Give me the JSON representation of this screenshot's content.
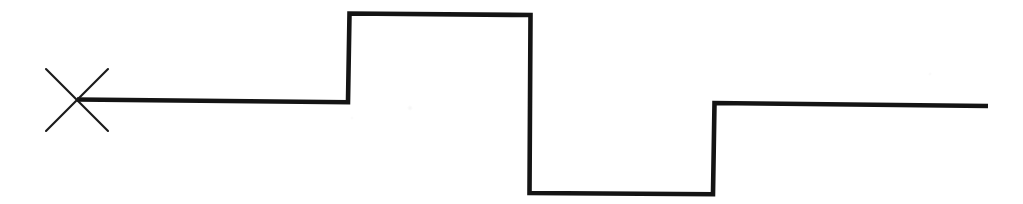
{
  "figure": {
    "kind": "line-drawing",
    "background_color": "#ffffff",
    "ink_color": "#141414",
    "canvas": {
      "width": 1023,
      "height": 204
    }
  },
  "chart_data": {
    "type": "line",
    "title": "",
    "subtitle": "",
    "xlabel": "",
    "ylabel": "",
    "legend": [],
    "legend_position": "none",
    "grid": false,
    "axis_visible": false,
    "tick_labels_x": [],
    "tick_labels_y": [],
    "xlim": [
      0,
      1023
    ],
    "ylim": [
      204,
      0
    ],
    "units": "pixels",
    "series": [
      {
        "name": "step-signal",
        "stroke_color": "#141414",
        "stroke_width": 4.6,
        "points": [
          [
            77,
            99.5
          ],
          [
            348,
            102.2
          ],
          [
            349.5,
            13.5
          ],
          [
            530.5,
            15.0
          ],
          [
            529.5,
            193.0
          ],
          [
            713,
            194.2
          ],
          [
            714.5,
            103.0
          ],
          [
            988,
            106.0
          ]
        ],
        "levels": [
          {
            "name": "baseline",
            "x_start": 77,
            "x_end": 348,
            "y_start": 99.5,
            "y_end": 102.2
          },
          {
            "name": "high-plateau",
            "x_start": 349.5,
            "x_end": 530.5,
            "y_start": 13.5,
            "y_end": 15.0
          },
          {
            "name": "low-plateau",
            "x_start": 529.5,
            "x_end": 713,
            "y_start": 193.0,
            "y_end": 194.2
          },
          {
            "name": "mid-plateau",
            "x_start": 714.5,
            "x_end": 988,
            "y_start": 103.0,
            "y_end": 106.0
          }
        ],
        "transitions": [
          {
            "name": "rising-edge-1",
            "x": 349,
            "from_y": 102.2,
            "to_y": 13.5
          },
          {
            "name": "falling-edge-1",
            "x": 530,
            "from_y": 15.0,
            "to_y": 193.0
          },
          {
            "name": "rising-edge-2",
            "x": 714,
            "from_y": 194.2,
            "to_y": 103.0
          }
        ]
      }
    ],
    "markers": [
      {
        "name": "origin-cross-marker",
        "shape": "x-cross",
        "center": [
          77,
          100
        ],
        "stroke_color": "#1a1a1a",
        "stroke_width": 2.1,
        "arms": [
          {
            "name": "cross-arm-nw-se",
            "x1": 46,
            "y1": 69,
            "x2": 108,
            "y2": 131
          },
          {
            "name": "cross-arm-ne-sw",
            "x1": 108,
            "y1": 69,
            "x2": 46,
            "y2": 131
          }
        ]
      }
    ]
  }
}
